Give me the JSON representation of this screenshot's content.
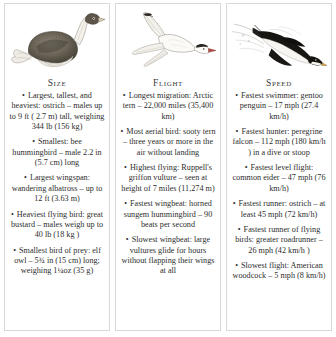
{
  "board": {
    "panels": [
      {
        "id": "size",
        "title": "Size",
        "illustration": "ostrich-illustration",
        "facts": [
          "Largest, tallest, and heaviest: ostrich – males up to 9 ft ( 2.7 m) tall, weighing 344 lb (156 kg)",
          "Smallest: bee hummingbird – male  2.2 in (5.7 cm) long",
          "Largest wingspan: wandering albatross – up to 12 ft (3.63 m)",
          "Heaviest flying bird: great bustard – males weigh up to 40 lb (18 kg )",
          "Smallest bird of prey: elf owl – 5¾ in (15 cm) long; weighing 1¼oz (35 g)"
        ]
      },
      {
        "id": "flight",
        "title": "Flight",
        "illustration": "arctic-tern-illustration",
        "facts": [
          "Longest migration: Arctic tern –  22,000 miles (35,400 km)",
          "Most aerial bird: sooty tern – three years or more in the air without landing",
          "Highest flying: Ruppell's griffon vulture – seen at height of 7 miles (11,274 m)",
          "Fastest wingbeat: horned sungem hummingbird – 90 beats per second",
          "Slowest wingbeat: large vultures glide for hours without flapping their wings at all"
        ]
      },
      {
        "id": "speed",
        "title": "Speed",
        "illustration": "diving-penguin-illustration",
        "facts": [
          "Fastest swimmer: gentoo penguin – 17 mph (27.4 km/h)",
          "Fastest hunter: peregrine falcon – 112 mph (180 km/h ) in a dive or stoop",
          "Fastest level flight: common eider – 47 mph (76 km/h)",
          "Fastest runner: ostrich – at least 45 mph (72 km/h)",
          "Fastest runner of flying birds: greater roadrunner – 26 mph (42 km/h )",
          "Slowest flight: American woodcock – 5 mph (8 km/h)"
        ]
      }
    ],
    "bullet_glyph": "•",
    "colors": {
      "background": "#ffffff",
      "border": "#d8d8d8",
      "text": "#2e2e2e"
    }
  }
}
